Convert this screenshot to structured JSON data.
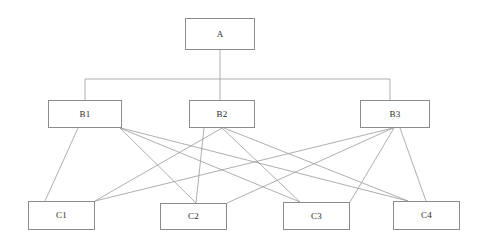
{
  "diagram": {
    "type": "hierarchy-tree",
    "title": "",
    "background_color": "#ffffff",
    "edge_color": "#9a9a9a",
    "box_border_color": "#8c8c8c",
    "box_fill_color": "#ffffff",
    "label_color": "#2b2b2b",
    "levels": [
      {
        "name": "root",
        "nodes": [
          {
            "id": "A",
            "label": "A",
            "x": 185,
            "y": 18,
            "w": 70,
            "h": 32
          }
        ]
      },
      {
        "name": "middle",
        "nodes": [
          {
            "id": "B1",
            "label": "B1",
            "x": 48,
            "y": 100,
            "w": 74,
            "h": 28
          },
          {
            "id": "B2",
            "label": "B2",
            "x": 189,
            "y": 100,
            "w": 66,
            "h": 28
          },
          {
            "id": "B3",
            "label": "B3",
            "x": 360,
            "y": 100,
            "w": 70,
            "h": 28
          }
        ]
      },
      {
        "name": "leaf",
        "nodes": [
          {
            "id": "C1",
            "label": "C1",
            "x": 28,
            "y": 201,
            "w": 67,
            "h": 29
          },
          {
            "id": "C2",
            "label": "C2",
            "x": 160,
            "y": 203,
            "w": 67,
            "h": 27
          },
          {
            "id": "C3",
            "label": "C3",
            "x": 283,
            "y": 202,
            "w": 67,
            "h": 28
          },
          {
            "id": "C4",
            "label": "C4",
            "x": 393,
            "y": 201,
            "w": 67,
            "h": 29
          }
        ]
      }
    ],
    "bus": {
      "from_node": "A",
      "drop_x": 220,
      "drop_y_start": 50,
      "bar_y": 79,
      "bar_x_left": 85,
      "bar_x_right": 390,
      "risers": [
        {
          "to": "B1",
          "x": 85,
          "y_end": 100
        },
        {
          "to": "B2",
          "x": 220,
          "y_end": 100
        },
        {
          "to": "B3",
          "x": 390,
          "y_end": 100
        }
      ]
    },
    "edges": [
      {
        "from": "B1",
        "to": "C1",
        "x1": 78,
        "y1": 128,
        "x2": 45,
        "y2": 201
      },
      {
        "from": "B1",
        "to": "C2",
        "x1": 120,
        "y1": 128,
        "x2": 196,
        "y2": 203
      },
      {
        "from": "B1",
        "to": "C3",
        "x1": 120,
        "y1": 128,
        "x2": 300,
        "y2": 202
      },
      {
        "from": "B1",
        "to": "C4",
        "x1": 121,
        "y1": 128,
        "x2": 408,
        "y2": 201
      },
      {
        "from": "B2",
        "to": "C1",
        "x1": 222,
        "y1": 128,
        "x2": 95,
        "y2": 201
      },
      {
        "from": "B2",
        "to": "C2",
        "x1": 204,
        "y1": 128,
        "x2": 196,
        "y2": 203
      },
      {
        "from": "B2",
        "to": "C3",
        "x1": 222,
        "y1": 128,
        "x2": 300,
        "y2": 202
      },
      {
        "from": "B2",
        "to": "C4",
        "x1": 224,
        "y1": 128,
        "x2": 408,
        "y2": 201
      },
      {
        "from": "B3",
        "to": "C1",
        "x1": 393,
        "y1": 128,
        "x2": 95,
        "y2": 201
      },
      {
        "from": "B3",
        "to": "C2",
        "x1": 393,
        "y1": 128,
        "x2": 227,
        "y2": 203
      },
      {
        "from": "B3",
        "to": "C3",
        "x1": 394,
        "y1": 128,
        "x2": 350,
        "y2": 202
      },
      {
        "from": "B3",
        "to": "C4",
        "x1": 400,
        "y1": 128,
        "x2": 426,
        "y2": 201
      }
    ]
  }
}
